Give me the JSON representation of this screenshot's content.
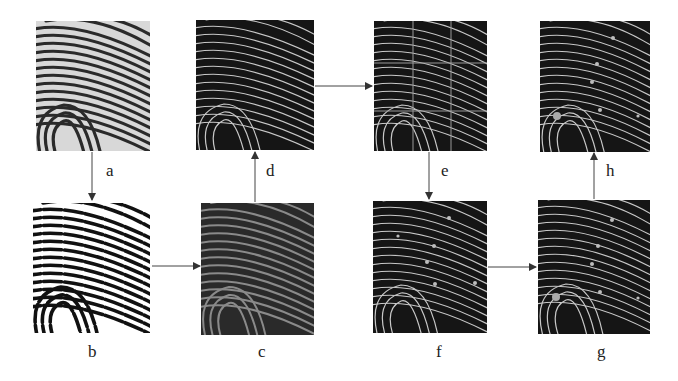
{
  "diagram": {
    "type": "fingerprint-processing-pipeline",
    "panels": [
      {
        "id": "a",
        "label": "a",
        "style": "original-grayscale",
        "x": 36,
        "y": 21,
        "w": 114,
        "h": 130
      },
      {
        "id": "b",
        "label": "b",
        "style": "binarized",
        "x": 33,
        "y": 203,
        "w": 117,
        "h": 130
      },
      {
        "id": "c",
        "label": "c",
        "style": "inverted-gray",
        "x": 201,
        "y": 203,
        "w": 113,
        "h": 132
      },
      {
        "id": "d",
        "label": "d",
        "style": "thinned",
        "x": 196,
        "y": 20,
        "w": 118,
        "h": 130
      },
      {
        "id": "e",
        "label": "e",
        "style": "thinned-grid-3x3",
        "x": 374,
        "y": 21,
        "w": 113,
        "h": 130
      },
      {
        "id": "f",
        "label": "f",
        "style": "thinned-minutiae",
        "x": 373,
        "y": 201,
        "w": 114,
        "h": 132
      },
      {
        "id": "g",
        "label": "g",
        "style": "thinned-minutiae-core",
        "x": 538,
        "y": 200,
        "w": 112,
        "h": 134
      },
      {
        "id": "h",
        "label": "h",
        "style": "thinned-minutiae-core",
        "x": 540,
        "y": 21,
        "w": 110,
        "h": 131
      }
    ],
    "labels": {
      "a": "a",
      "b": "b",
      "c": "c",
      "d": "d",
      "e": "e",
      "f": "f",
      "g": "g",
      "h": "h"
    },
    "flow": [
      "a",
      "b",
      "c",
      "d",
      "e",
      "f",
      "g",
      "h"
    ],
    "edges": [
      {
        "from": "a",
        "to": "b",
        "direction": "down"
      },
      {
        "from": "b",
        "to": "c",
        "direction": "right"
      },
      {
        "from": "c",
        "to": "d",
        "direction": "up"
      },
      {
        "from": "d",
        "to": "e",
        "direction": "right"
      },
      {
        "from": "e",
        "to": "f",
        "direction": "down"
      },
      {
        "from": "f",
        "to": "g",
        "direction": "right"
      },
      {
        "from": "g",
        "to": "h",
        "direction": "up"
      }
    ],
    "colors": {
      "background": "#ffffff",
      "arrow": "#333333",
      "dark_panel": "#1a1a1a",
      "ridge_light": "#cfcfcf"
    }
  }
}
